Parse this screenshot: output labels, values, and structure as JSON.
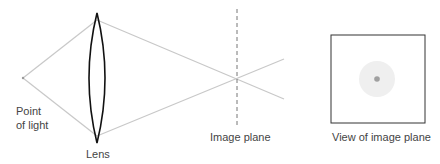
{
  "diagram": {
    "labels": {
      "point_of_light_line1": "Point",
      "point_of_light_line2": "of light",
      "lens": "Lens",
      "image_plane": "Image plane",
      "view_of_image_plane": "View of image plane"
    },
    "colors": {
      "rays": "#c8c8c8",
      "lens": "#111111",
      "plane": "#777777",
      "box": "#333333",
      "dot": "#a0a0a0",
      "halo": "#efefef"
    }
  }
}
